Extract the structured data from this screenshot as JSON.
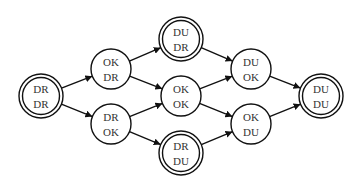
{
  "diagram": {
    "type": "state-transition-graph",
    "colors": {
      "stroke": "#111111",
      "text": "#333333",
      "background": "#ffffff"
    },
    "nodes": [
      {
        "id": "n1",
        "line1": "DR",
        "line2": "DR",
        "double": true,
        "cx": 41,
        "cy": 96
      },
      {
        "id": "n2",
        "line1": "OK",
        "line2": "DR",
        "double": false,
        "cx": 111,
        "cy": 69
      },
      {
        "id": "n3",
        "line1": "DR",
        "line2": "OK",
        "double": false,
        "cx": 111,
        "cy": 124
      },
      {
        "id": "n4",
        "line1": "DU",
        "line2": "DR",
        "double": true,
        "cx": 181,
        "cy": 39
      },
      {
        "id": "n5",
        "line1": "OK",
        "line2": "OK",
        "double": false,
        "cx": 181,
        "cy": 96
      },
      {
        "id": "n6",
        "line1": "DR",
        "line2": "DU",
        "double": true,
        "cx": 181,
        "cy": 153
      },
      {
        "id": "n7",
        "line1": "DU",
        "line2": "OK",
        "double": false,
        "cx": 251,
        "cy": 69
      },
      {
        "id": "n8",
        "line1": "OK",
        "line2": "DU",
        "double": false,
        "cx": 251,
        "cy": 124
      },
      {
        "id": "n9",
        "line1": "DU",
        "line2": "DU",
        "double": true,
        "cx": 321,
        "cy": 96
      }
    ],
    "edges": [
      {
        "from": "n1",
        "to": "n2"
      },
      {
        "from": "n1",
        "to": "n3"
      },
      {
        "from": "n2",
        "to": "n4"
      },
      {
        "from": "n2",
        "to": "n5"
      },
      {
        "from": "n3",
        "to": "n5"
      },
      {
        "from": "n3",
        "to": "n6"
      },
      {
        "from": "n4",
        "to": "n7"
      },
      {
        "from": "n5",
        "to": "n7"
      },
      {
        "from": "n5",
        "to": "n8"
      },
      {
        "from": "n6",
        "to": "n8"
      },
      {
        "from": "n7",
        "to": "n9"
      },
      {
        "from": "n8",
        "to": "n9"
      }
    ]
  }
}
